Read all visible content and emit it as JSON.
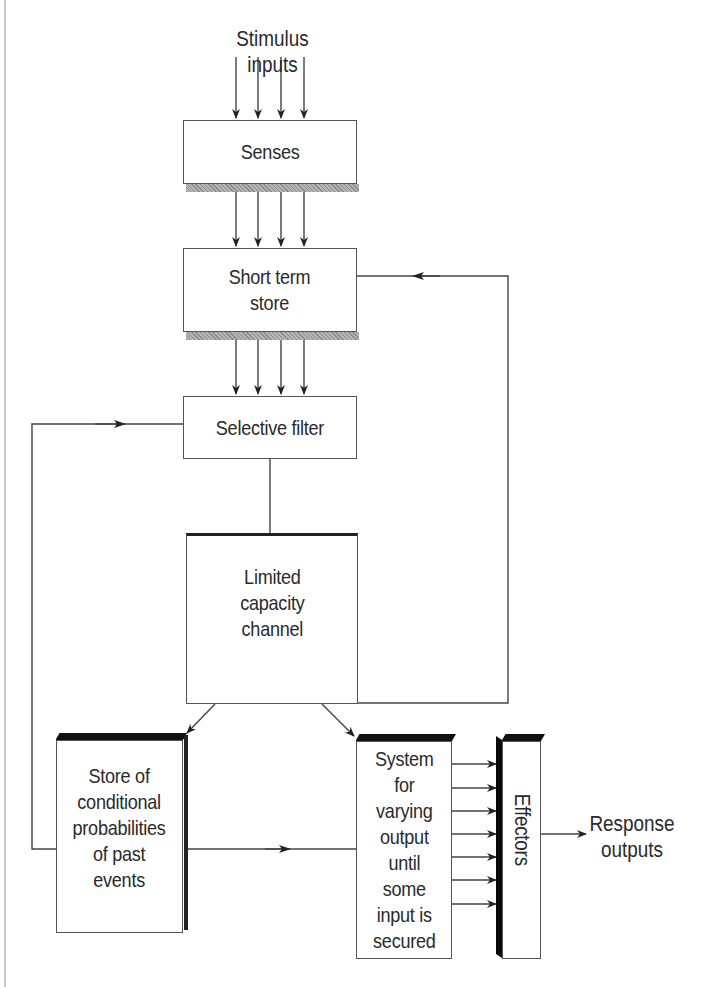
{
  "diagram": {
    "type": "flowchart",
    "nodes": {
      "stimulus_inputs": {
        "label": "Stimulus inputs"
      },
      "senses": {
        "label": "Senses"
      },
      "short_term_store": {
        "label": "Short term\nstore"
      },
      "selective_filter": {
        "label": "Selective filter"
      },
      "limited_capacity_channel": {
        "label": "Limited\ncapacity\nchannel"
      },
      "store_conditional": {
        "label": "Store of\nconditional\nprobabilities\nof past\nevents"
      },
      "system_varying": {
        "label": "System\nfor\nvarying\noutput\nuntil\nsome\ninput is\nsecured"
      },
      "effectors": {
        "label": "Effectors"
      },
      "response_outputs": {
        "label": "Response\noutputs"
      }
    },
    "edges": [
      {
        "from": "stimulus_inputs",
        "to": "senses",
        "count": 4
      },
      {
        "from": "senses",
        "to": "short_term_store",
        "count": 4
      },
      {
        "from": "short_term_store",
        "to": "selective_filter",
        "count": 4
      },
      {
        "from": "selective_filter",
        "to": "limited_capacity_channel",
        "count": 1,
        "arrow": false
      },
      {
        "from": "limited_capacity_channel",
        "to": "store_conditional",
        "count": 1
      },
      {
        "from": "limited_capacity_channel",
        "to": "system_varying",
        "count": 1
      },
      {
        "from": "limited_capacity_channel",
        "to": "short_term_store",
        "count": 1,
        "note": "feedback loop on right"
      },
      {
        "from": "store_conditional",
        "to": "selective_filter",
        "count": 1,
        "note": "feedback loop on left"
      },
      {
        "from": "store_conditional",
        "to": "system_varying",
        "count": 1
      },
      {
        "from": "system_varying",
        "to": "effectors",
        "count": 7
      },
      {
        "from": "effectors",
        "to": "response_outputs",
        "count": 1
      }
    ],
    "colors": {
      "line": "#444444",
      "bevel": "#111111",
      "shadow": "#9a9a9a",
      "page_rule": "#c8c8c8"
    }
  }
}
